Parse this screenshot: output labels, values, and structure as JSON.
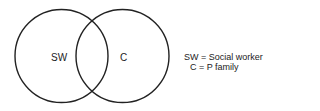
{
  "diagram": {
    "type": "venn",
    "circles": [
      {
        "id": "sw",
        "label": "SW",
        "cx": 61.5,
        "cy": 56,
        "r": 46.5
      },
      {
        "id": "c",
        "label": "C",
        "cx": 122.5,
        "cy": 56,
        "r": 46.5
      }
    ],
    "stroke_color": "#222222",
    "legend": [
      {
        "text": "SW = Social worker"
      },
      {
        "text": "C = P family"
      }
    ]
  }
}
